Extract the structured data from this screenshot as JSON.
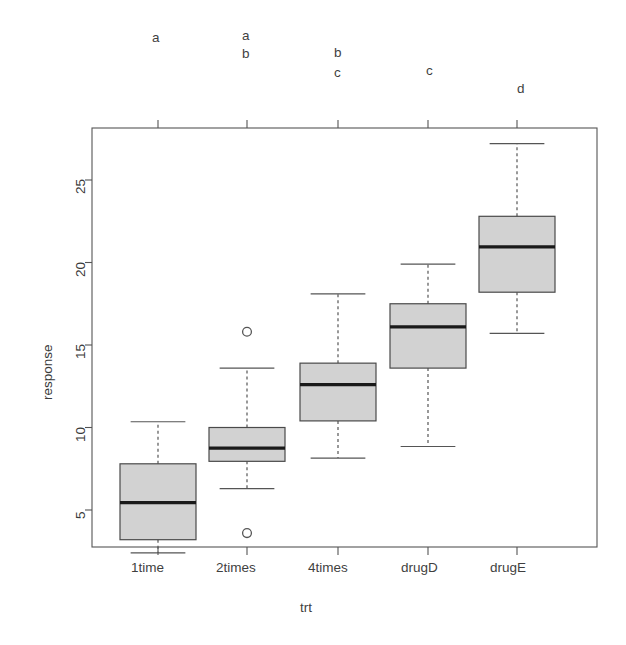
{
  "chart_data": {
    "type": "box",
    "title": "",
    "xlabel": "trt",
    "ylabel": "response",
    "ylim": [
      2.0,
      27.6
    ],
    "yticks": [
      5,
      10,
      15,
      20,
      25
    ],
    "ytick_labels": [
      "5",
      "10",
      "15",
      "20",
      "25"
    ],
    "categories": [
      "1time",
      "2times",
      "4times",
      "drugD",
      "drugE"
    ],
    "grid": false,
    "legend": null,
    "box_fill": "#d2d2d2",
    "box_border": "#4a4a4a",
    "median_color": "#1a1a1a",
    "whisker_style": "dashed",
    "boxes": [
      {
        "category": "1time",
        "whisker_low": 2.4,
        "q1": 3.2,
        "median": 5.45,
        "q3": 7.8,
        "whisker_high": 10.35,
        "outliers": [],
        "annotation": [
          "a"
        ]
      },
      {
        "category": "2times",
        "whisker_low": 6.3,
        "q1": 7.95,
        "median": 8.75,
        "q3": 10.0,
        "whisker_high": 13.6,
        "outliers": [
          15.8,
          3.6
        ],
        "annotation": [
          "a",
          "b"
        ]
      },
      {
        "category": "4times",
        "whisker_low": 8.15,
        "q1": 10.4,
        "median": 12.6,
        "q3": 13.9,
        "whisker_high": 18.1,
        "outliers": [],
        "annotation": [
          "b",
          "c"
        ]
      },
      {
        "category": "drugD",
        "whisker_low": 8.85,
        "q1": 13.6,
        "median": 16.1,
        "q3": 17.5,
        "whisker_high": 19.9,
        "outliers": [],
        "annotation": [
          "c"
        ]
      },
      {
        "category": "drugE",
        "whisker_low": 15.7,
        "q1": 18.2,
        "median": 20.95,
        "q3": 22.8,
        "whisker_high": 27.2,
        "outliers": [],
        "annotation": [
          "d"
        ]
      }
    ]
  },
  "axis": {
    "y_title": "response",
    "x_title": "trt",
    "x_tick_labels": [
      "1time",
      "2times",
      "4times",
      "drugD",
      "drugE"
    ],
    "y_tick_labels": [
      "5",
      "10",
      "15",
      "20",
      "25"
    ]
  },
  "annotations": {
    "group1": [
      "a"
    ],
    "group2": [
      "a",
      "b"
    ],
    "group3": [
      "b",
      "c"
    ],
    "group4": [
      "c"
    ],
    "group5": [
      "d"
    ]
  }
}
